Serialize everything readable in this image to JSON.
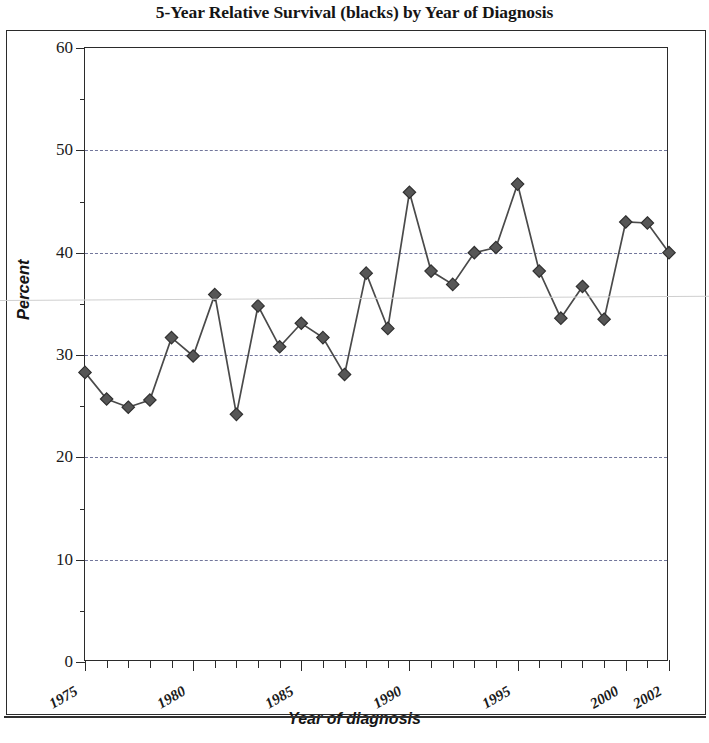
{
  "chart_data": {
    "type": "line",
    "title": "5-Year Relative Survival (blacks) by Year of Diagnosis",
    "xlabel": "Year of diagnosis",
    "ylabel": "Percent",
    "xlim": [
      1975,
      2002
    ],
    "ylim": [
      0,
      60
    ],
    "ytick_step": 10,
    "yminor_step": 5,
    "xtick_step": 1,
    "grid": "horizontal-dashed",
    "legend": "none",
    "marker": "diamond",
    "series_color": "#4a4a4a",
    "grid_color": "#5a5f8a",
    "axis_color": "#2b2b2b",
    "x": [
      1975,
      1976,
      1977,
      1978,
      1979,
      1980,
      1981,
      1982,
      1983,
      1984,
      1985,
      1986,
      1987,
      1988,
      1989,
      1990,
      1991,
      1992,
      1993,
      1994,
      1995,
      1996,
      1997,
      1998,
      1999,
      2000,
      2001,
      2002
    ],
    "values": [
      28.3,
      25.7,
      24.9,
      25.6,
      31.7,
      29.9,
      35.9,
      24.2,
      34.8,
      30.8,
      33.1,
      31.7,
      28.1,
      38.0,
      32.6,
      45.9,
      38.2,
      36.9,
      40.0,
      40.5,
      46.7,
      38.2,
      33.6,
      36.7,
      33.5,
      43.0,
      42.9,
      40.0
    ],
    "ytick_labels": [
      "0",
      "10",
      "20",
      "30",
      "40",
      "50",
      "60"
    ],
    "ytick_values": [
      0,
      10,
      20,
      30,
      40,
      50,
      60
    ],
    "xtick_labels": [
      "1975",
      "1980",
      "1985",
      "1990",
      "1995",
      "2000",
      "2002"
    ],
    "xtick_label_values": [
      1975,
      1980,
      1985,
      1990,
      1995,
      2000,
      2002
    ]
  }
}
